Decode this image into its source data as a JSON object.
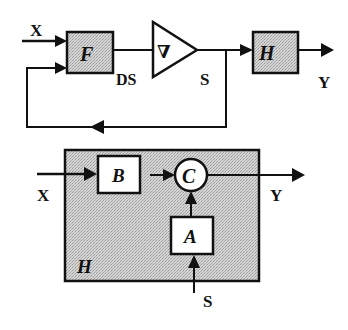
{
  "diagram": {
    "top": {
      "input_label": "X",
      "block_f": "F",
      "ds_label": "DS",
      "amplifier_symbol": "∇",
      "s_label": "S",
      "block_h": "H",
      "output_label": "Y"
    },
    "bottom": {
      "input_label": "X",
      "block_b": "B",
      "node_c": "C",
      "block_a": "A",
      "container_label": "H",
      "output_label": "Y",
      "s_label": "S"
    },
    "colors": {
      "stroke": "#111111",
      "shaded_fill": "#c9c9c9",
      "white_fill": "#ffffff"
    }
  }
}
